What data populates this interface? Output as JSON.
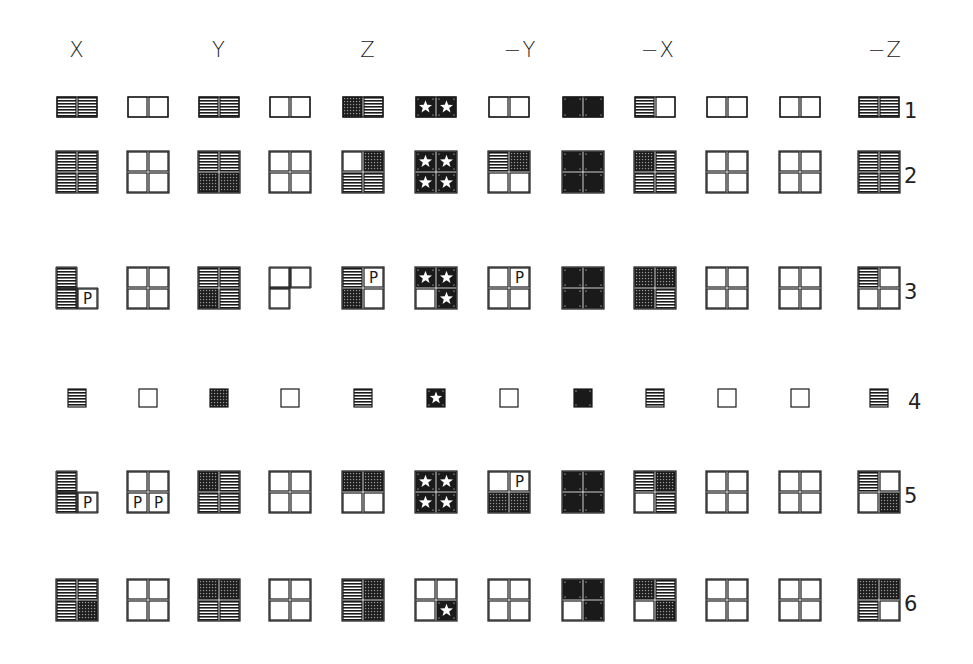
{
  "legend": {
    "h": "horizontal-hatch",
    "g": "grid-hatch",
    "s": "star-on-black",
    "c": "black-circle",
    "p": "letter-P",
    "e": "empty",
    "x": "absent"
  },
  "p_letter": "P",
  "columns": [
    {
      "label": "X",
      "x": 77
    },
    {
      "label": "",
      "x": 148
    },
    {
      "label": "Y",
      "x": 219
    },
    {
      "label": "",
      "x": 290
    },
    {
      "label": "Z",
      "x": 363
    },
    {
      "label": "",
      "x": 436
    },
    {
      "label": "−Y",
      "x": 509
    },
    {
      "label": "",
      "x": 583
    },
    {
      "label": "−X",
      "x": 655
    },
    {
      "label": "",
      "x": 727
    },
    {
      "label": "",
      "x": 800
    },
    {
      "label": "−Z",
      "x": 879
    }
  ],
  "column_headers": [
    {
      "label": "X",
      "x": 77
    },
    {
      "label": "Y",
      "x": 219
    },
    {
      "label": "Z",
      "x": 368
    },
    {
      "label": "−Y",
      "x": 520
    },
    {
      "label": "−X",
      "x": 658
    },
    {
      "label": "−Z",
      "x": 885
    }
  ],
  "rows": [
    {
      "label": "1",
      "y": 107,
      "kind": "halves",
      "cells": [
        [
          "h",
          "h"
        ],
        [
          "e",
          "e"
        ],
        [
          "h",
          "h"
        ],
        [
          "e",
          "e"
        ],
        [
          "g",
          "h"
        ],
        [
          "s",
          "s"
        ],
        [
          "e",
          "e"
        ],
        [
          "c",
          "c"
        ],
        [
          "h",
          "e"
        ],
        [
          "e",
          "e"
        ],
        [
          "e",
          "e"
        ],
        [
          "h",
          "h"
        ]
      ]
    },
    {
      "label": "2",
      "y": 172,
      "kind": "quad",
      "cells": [
        [
          "h",
          "h",
          "h",
          "h"
        ],
        [
          "e",
          "e",
          "e",
          "e"
        ],
        [
          "h",
          "h",
          "g",
          "g"
        ],
        [
          "e",
          "e",
          "e",
          "e"
        ],
        [
          "e",
          "g",
          "h",
          "h"
        ],
        [
          "s",
          "s",
          "s",
          "s"
        ],
        [
          "h",
          "g",
          "e",
          "e"
        ],
        [
          "c",
          "c",
          "c",
          "c"
        ],
        [
          "g",
          "h",
          "h",
          "h"
        ],
        [
          "e",
          "e",
          "e",
          "e"
        ],
        [
          "e",
          "e",
          "e",
          "e"
        ],
        [
          "h",
          "h",
          "h",
          "h"
        ]
      ]
    },
    {
      "label": "3",
      "y": 288,
      "kind": "quad",
      "cells": [
        [
          "h",
          "x",
          "h",
          "p"
        ],
        [
          "e",
          "e",
          "e",
          "e"
        ],
        [
          "h",
          "h",
          "g",
          "h"
        ],
        [
          "e",
          "e",
          "e",
          "x"
        ],
        [
          "h",
          "p",
          "g",
          "e"
        ],
        [
          "s",
          "s",
          "e",
          "s"
        ],
        [
          "e",
          "p",
          "e",
          "e"
        ],
        [
          "c",
          "c",
          "c",
          "c"
        ],
        [
          "g",
          "g",
          "g",
          "h"
        ],
        [
          "e",
          "e",
          "e",
          "e"
        ],
        [
          "e",
          "e",
          "e",
          "e"
        ],
        [
          "h",
          "e",
          "e",
          "e"
        ]
      ]
    },
    {
      "label": "4",
      "y": 398,
      "kind": "single",
      "cells": [
        "h",
        "e",
        "g",
        "e",
        "h",
        "s",
        "e",
        "c",
        "h",
        "e",
        "e",
        "h"
      ]
    },
    {
      "label": "5",
      "y": 492,
      "kind": "quad",
      "cells": [
        [
          "h",
          "x",
          "h",
          "p"
        ],
        [
          "e",
          "e",
          "p",
          "p"
        ],
        [
          "g",
          "h",
          "h",
          "h"
        ],
        [
          "e",
          "e",
          "e",
          "e"
        ],
        [
          "g",
          "g",
          "e",
          "e"
        ],
        [
          "s",
          "s",
          "s",
          "s"
        ],
        [
          "e",
          "p",
          "g",
          "g"
        ],
        [
          "c",
          "c",
          "c",
          "c"
        ],
        [
          "h",
          "g",
          "e",
          "h"
        ],
        [
          "e",
          "e",
          "e",
          "e"
        ],
        [
          "e",
          "e",
          "e",
          "e"
        ],
        [
          "h",
          "e",
          "e",
          "g"
        ]
      ]
    },
    {
      "label": "6",
      "y": 600,
      "kind": "quad",
      "cells": [
        [
          "h",
          "h",
          "h",
          "g"
        ],
        [
          "e",
          "e",
          "e",
          "e"
        ],
        [
          "g",
          "g",
          "h",
          "h"
        ],
        [
          "e",
          "e",
          "e",
          "e"
        ],
        [
          "h",
          "g",
          "h",
          "g"
        ],
        [
          "e",
          "e",
          "e",
          "s"
        ],
        [
          "e",
          "e",
          "e",
          "e"
        ],
        [
          "c",
          "c",
          "e",
          "c"
        ],
        [
          "g",
          "h",
          "e",
          "g"
        ],
        [
          "e",
          "e",
          "e",
          "e"
        ],
        [
          "e",
          "e",
          "e",
          "e"
        ],
        [
          "g",
          "g",
          "h",
          "e"
        ]
      ]
    }
  ],
  "sizes": {
    "halves": {
      "w": 40,
      "h": 20
    },
    "quad": {
      "w": 40,
      "h": 40
    },
    "single": {
      "w": 18,
      "h": 18
    }
  },
  "colors": {
    "ink": "#1a1a1a",
    "paper": "#ffffff"
  }
}
